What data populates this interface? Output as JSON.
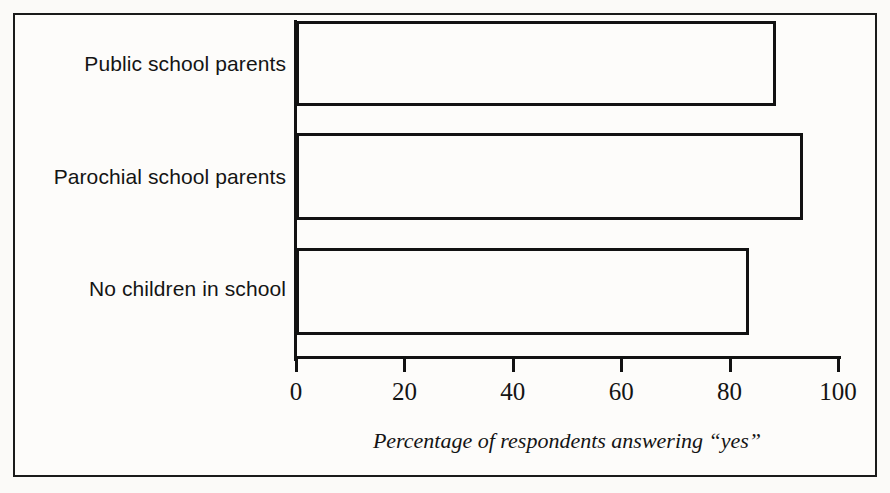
{
  "figure": {
    "background_color": "#fdfcfa",
    "ink_color": "#121212",
    "frame": "outer-rule"
  },
  "chart_data": {
    "type": "bar",
    "orientation": "horizontal",
    "title": "",
    "subtitle": "",
    "categories": [
      "Public school parents",
      "Parochial school parents",
      "No children in school"
    ],
    "values": [
      88,
      93,
      83
    ],
    "series": [
      {
        "name": "Percentage answering \"yes\"",
        "values": [
          88,
          93,
          83
        ]
      }
    ],
    "xlabel": "Percentage of respondents answering “yes”",
    "ylabel": "",
    "xlim": [
      0,
      100
    ],
    "xticks": [
      0,
      20,
      40,
      60,
      80,
      100
    ],
    "xticklabels": [
      "0",
      "20",
      "40",
      "60",
      "80",
      "100"
    ],
    "grid": false,
    "legend": false,
    "bar_style": "hollow-black-outline"
  },
  "axis": {
    "title": "Percentage of respondents answering “yes”",
    "ticks": [
      {
        "value": 0,
        "label": "0"
      },
      {
        "value": 20,
        "label": "20"
      },
      {
        "value": 40,
        "label": "40"
      },
      {
        "value": 60,
        "label": "60"
      },
      {
        "value": 80,
        "label": "80"
      },
      {
        "value": 100,
        "label": "100"
      }
    ]
  },
  "bars": [
    {
      "label": "Public school parents",
      "value": 88
    },
    {
      "label": "Parochial school parents",
      "value": 93
    },
    {
      "label": "No children in school",
      "value": 83
    }
  ]
}
